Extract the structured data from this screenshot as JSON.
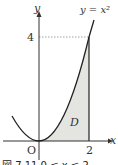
{
  "diagram": {
    "curve_label": "y = x²",
    "axis_x_label": "x",
    "axis_y_label": "y",
    "origin_label": "O",
    "x_tick_label": "2",
    "y_tick_label": "4",
    "region_label": "D",
    "caption": "図 7.11  0 ≦ x ≦ 2",
    "colors": {
      "axis": "#333333",
      "curve": "#222222",
      "region_fill": "#e4e4e0",
      "dotted_guide": "#888888"
    }
  }
}
